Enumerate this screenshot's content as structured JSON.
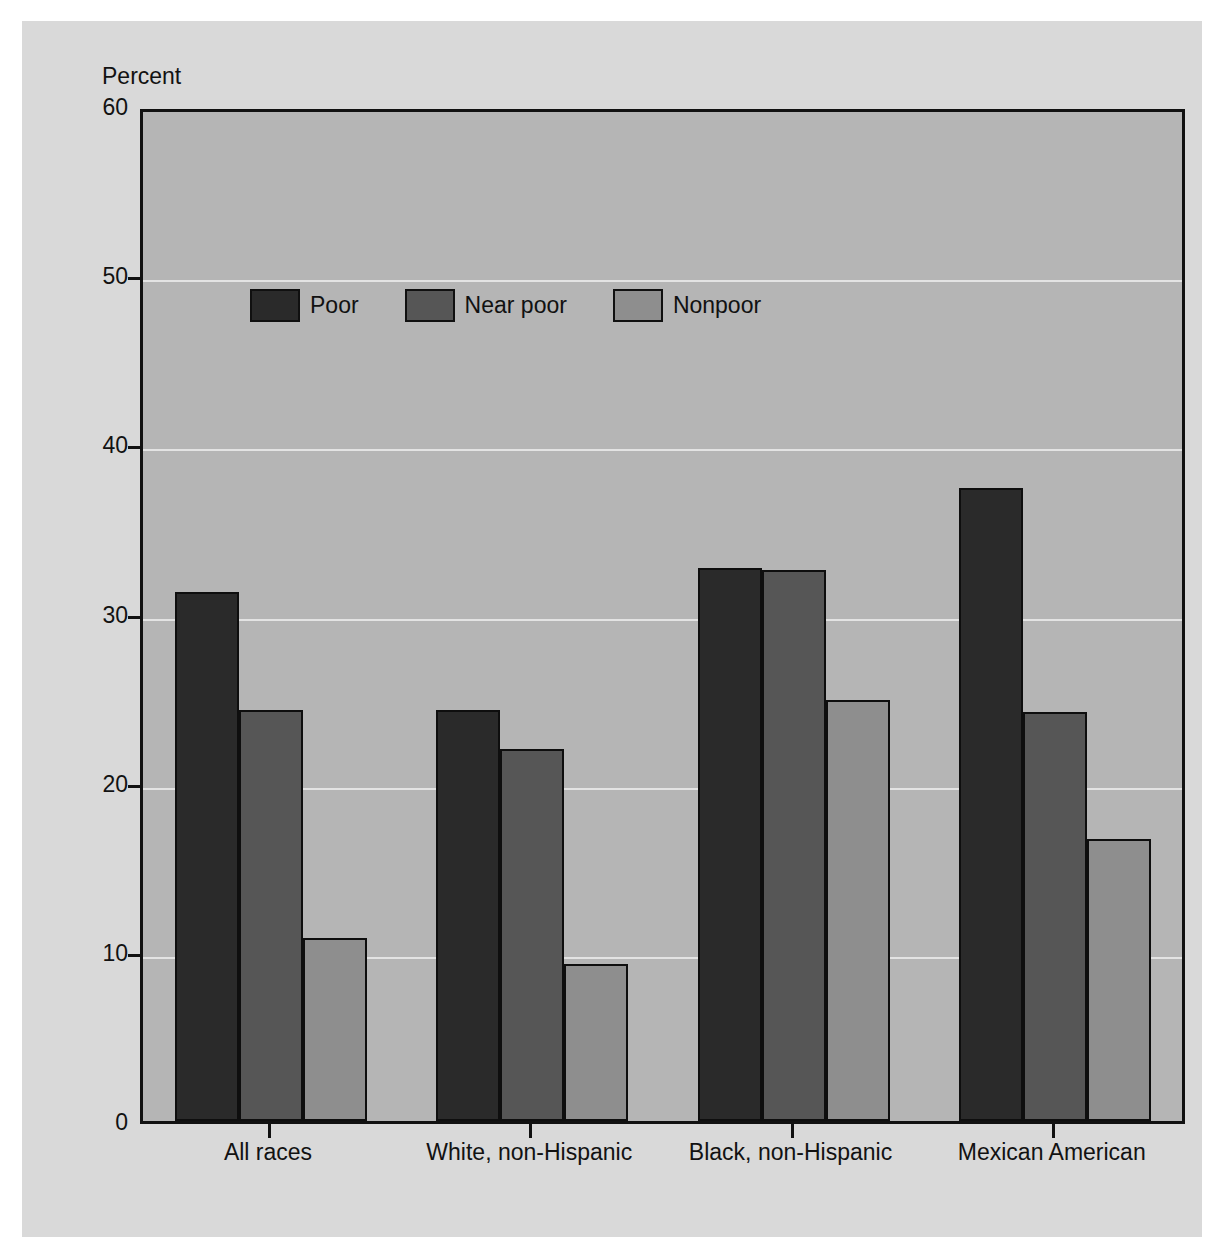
{
  "figure": {
    "caption_fragment": "",
    "y_axis_title": "Percent"
  },
  "legend": {
    "entries": [
      {
        "label": "Poor",
        "color": "#2a2a2a"
      },
      {
        "label": "Near poor",
        "color": "#565656"
      },
      {
        "label": "Nonpoor",
        "color": "#8e8e8e"
      }
    ]
  },
  "colors": {
    "page_background": "#ffffff",
    "panel_background": "#d9d9d9",
    "plot_background": "#b5b5b5",
    "gridline": "#ebebeb",
    "axis": "#111111",
    "text": "#121212"
  },
  "chart_data": {
    "type": "bar",
    "title": "",
    "xlabel": "",
    "ylabel": "Percent",
    "ylim": [
      0,
      60
    ],
    "yticks": [
      0,
      10,
      20,
      30,
      40,
      50,
      60
    ],
    "ytick_labels": [
      "0",
      "10",
      "20",
      "30",
      "40",
      "50",
      "60"
    ],
    "grid": true,
    "legend_position": "inside upper left",
    "categories": [
      "All races",
      "White, non-Hispanic",
      "Black, non-Hispanic",
      "Mexican American"
    ],
    "series": [
      {
        "name": "Poor",
        "color": "#2a2a2a",
        "values": [
          31.3,
          24.3,
          32.7,
          37.4
        ]
      },
      {
        "name": "Near poor",
        "color": "#565656",
        "values": [
          24.3,
          22.0,
          32.6,
          24.2
        ]
      },
      {
        "name": "Nonpoor",
        "color": "#8e8e8e",
        "values": [
          10.8,
          9.3,
          24.9,
          16.7
        ]
      }
    ]
  }
}
